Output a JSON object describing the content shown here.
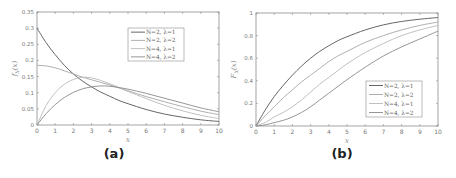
{
  "chart_data": [
    {
      "type": "line",
      "panel_label": "(a)",
      "title": "",
      "xlabel": "x",
      "ylabel": "f_X(x)",
      "xlim": [
        0,
        10
      ],
      "ylim": [
        0,
        0.35
      ],
      "xticks": [
        0,
        1,
        2,
        3,
        4,
        5,
        6,
        7,
        8,
        9,
        10
      ],
      "yticks": [
        0,
        0.05,
        0.1,
        0.15,
        0.2,
        0.25,
        0.3,
        0.35
      ],
      "ytick_labels": [
        "0",
        "0.05",
        "0.1",
        "0.15",
        "0.2",
        "0.25",
        "0.3",
        "0.35"
      ],
      "grid": false,
      "legend_position": "upper right",
      "x": [
        0,
        0.5,
        1,
        1.5,
        2,
        2.5,
        3,
        3.5,
        4,
        4.5,
        5,
        6,
        7,
        8,
        9,
        10
      ],
      "series": [
        {
          "name": "N=2, λ=1",
          "color": "#555555",
          "values": [
            0.3,
            0.255,
            0.218,
            0.185,
            0.158,
            0.136,
            0.118,
            0.102,
            0.089,
            0.076,
            0.066,
            0.048,
            0.034,
            0.024,
            0.016,
            0.011
          ]
        },
        {
          "name": "N=2, λ=2",
          "color": "#a6a6a6",
          "values": [
            0.185,
            0.183,
            0.177,
            0.168,
            0.158,
            0.148,
            0.14,
            0.132,
            0.124,
            0.115,
            0.106,
            0.088,
            0.072,
            0.057,
            0.043,
            0.032
          ]
        },
        {
          "name": "N=4, λ=1",
          "color": "#b9b9b9",
          "values": [
            0.0,
            0.06,
            0.1,
            0.126,
            0.141,
            0.148,
            0.146,
            0.138,
            0.128,
            0.116,
            0.104,
            0.082,
            0.061,
            0.044,
            0.03,
            0.02
          ]
        },
        {
          "name": "N=4, λ=2",
          "color": "#8a8a8a",
          "values": [
            0.0,
            0.035,
            0.063,
            0.085,
            0.101,
            0.112,
            0.118,
            0.121,
            0.12,
            0.116,
            0.111,
            0.098,
            0.083,
            0.068,
            0.053,
            0.041
          ]
        }
      ]
    },
    {
      "type": "line",
      "panel_label": "(b)",
      "title": "",
      "xlabel": "x",
      "ylabel": "F_X(x)",
      "xlim": [
        0,
        10
      ],
      "ylim": [
        0,
        1
      ],
      "xticks": [
        0,
        1,
        2,
        3,
        4,
        5,
        6,
        7,
        8,
        9,
        10
      ],
      "yticks": [
        0,
        0.2,
        0.4,
        0.6,
        0.8,
        1
      ],
      "ytick_labels": [
        "0",
        "0.2",
        "0.4",
        "0.6",
        "0.8",
        "1"
      ],
      "grid": false,
      "legend_position": "lower right",
      "x": [
        0,
        0.5,
        1,
        1.5,
        2,
        2.5,
        3,
        3.5,
        4,
        4.5,
        5,
        6,
        7,
        8,
        9,
        10
      ],
      "series": [
        {
          "name": "N=2, λ=1",
          "color": "#555555",
          "values": [
            0.0,
            0.14,
            0.26,
            0.36,
            0.45,
            0.53,
            0.6,
            0.66,
            0.71,
            0.755,
            0.79,
            0.85,
            0.895,
            0.925,
            0.945,
            0.96
          ]
        },
        {
          "name": "N=2, λ=2",
          "color": "#a6a6a6",
          "values": [
            0.0,
            0.09,
            0.17,
            0.25,
            0.32,
            0.39,
            0.45,
            0.51,
            0.57,
            0.62,
            0.66,
            0.74,
            0.8,
            0.85,
            0.89,
            0.92
          ]
        },
        {
          "name": "N=4, λ=1",
          "color": "#b9b9b9",
          "values": [
            0.0,
            0.03,
            0.08,
            0.12,
            0.17,
            0.23,
            0.3,
            0.37,
            0.43,
            0.49,
            0.55,
            0.65,
            0.73,
            0.8,
            0.85,
            0.89
          ]
        },
        {
          "name": "N=4, λ=2",
          "color": "#8a8a8a",
          "values": [
            0.0,
            0.01,
            0.03,
            0.05,
            0.08,
            0.12,
            0.17,
            0.23,
            0.29,
            0.35,
            0.41,
            0.52,
            0.62,
            0.7,
            0.77,
            0.84
          ]
        }
      ]
    }
  ],
  "captions": {
    "a": "(a)",
    "b": "(b)"
  },
  "axis_labels": {
    "a_x": "x",
    "a_y": "f_X(x)",
    "b_x": "x",
    "b_y": "F_X(x)"
  }
}
